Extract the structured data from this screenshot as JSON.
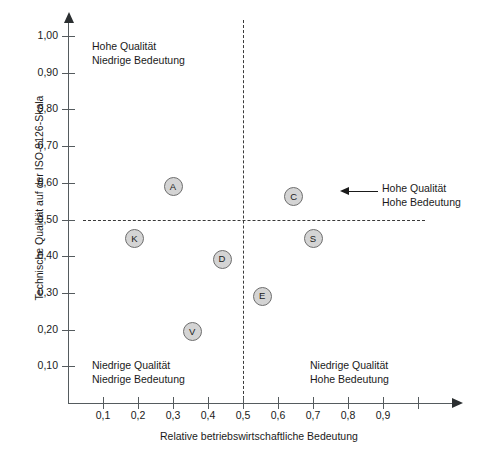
{
  "chart_data": {
    "type": "scatter",
    "title": "",
    "xlabel": "Relative betriebswirtschaftliche Bedeutung",
    "ylabel": "Technische Qualität auf der ISO-9126-Skala",
    "xlim": [
      0,
      1.0
    ],
    "ylim": [
      0,
      1.05
    ],
    "grid": false,
    "legend": "none",
    "xticks": [
      0.1,
      0.2,
      0.3,
      0.4,
      0.5,
      0.6,
      0.7,
      0.8,
      0.9,
      1.0
    ],
    "xticklabels": [
      "0,1",
      "0,2",
      "0,3",
      "0,4",
      "0,5",
      "0,6",
      "0,7",
      "0,8",
      "0,9",
      ""
    ],
    "yticks": [
      0.1,
      0.2,
      0.3,
      0.4,
      0.5,
      0.6,
      0.7,
      0.8,
      0.9,
      1.0
    ],
    "yticklabels": [
      "0,10",
      "0,20",
      "0,30",
      "0,40",
      "0,50",
      "0,60",
      "0,70",
      "0,80",
      "0,90",
      "1,00"
    ],
    "points": [
      {
        "label": "A",
        "x": 0.3,
        "y": 0.59
      },
      {
        "label": "C",
        "x": 0.645,
        "y": 0.562
      },
      {
        "label": "K",
        "x": 0.19,
        "y": 0.447
      },
      {
        "label": "S",
        "x": 0.7,
        "y": 0.447
      },
      {
        "label": "D",
        "x": 0.44,
        "y": 0.392
      },
      {
        "label": "E",
        "x": 0.555,
        "y": 0.291
      },
      {
        "label": "V",
        "x": 0.355,
        "y": 0.194
      }
    ],
    "quadrant_dividers": {
      "x": 0.5,
      "y": 0.5
    },
    "annotations": {
      "top_left": {
        "line1": "Hohe Qualität",
        "line2": "Niedrige Bedeutung"
      },
      "top_right_callout": {
        "line1": "Hohe Qualität",
        "line2": "Hohe Bedeutung"
      },
      "bottom_left": {
        "line1": "Niedrige Qualität",
        "line2": "Niedrige Bedeutung"
      },
      "bottom_right": {
        "line1": "Niedrige Qualität",
        "line2": "Hohe Bedeutung"
      }
    },
    "colors": {
      "marker_fill": "#d4d4d4",
      "marker_stroke": "#6e6e6e",
      "axis": "#555b5e",
      "text": "#1a1a1a",
      "divider": "#3a3a3a"
    }
  }
}
